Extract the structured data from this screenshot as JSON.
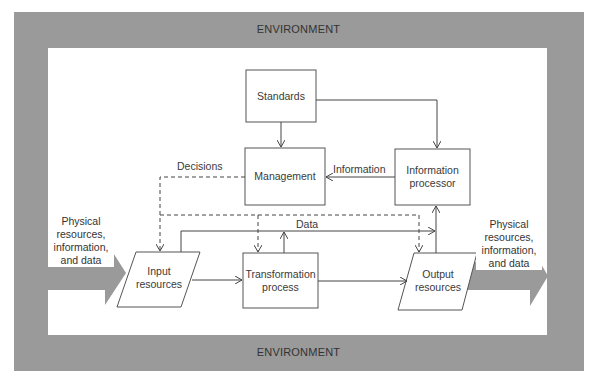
{
  "environment": {
    "top_label": "ENVIRONMENT",
    "bottom_label": "ENVIRONMENT",
    "frame_color": "#9a9a9a"
  },
  "nodes": {
    "standards": {
      "label": "Standards",
      "shape": "rectangle"
    },
    "management": {
      "label": "Management",
      "shape": "rectangle"
    },
    "information_processor": {
      "label_line1": "Information",
      "label_line2": "processor",
      "shape": "rectangle"
    },
    "input_resources": {
      "label_line1": "Input",
      "label_line2": "resources",
      "shape": "parallelogram"
    },
    "transformation_process": {
      "label_line1": "Transformation",
      "label_line2": "process",
      "shape": "rectangle"
    },
    "output_resources": {
      "label_line1": "Output",
      "label_line2": "resources",
      "shape": "parallelogram"
    }
  },
  "flows": {
    "decisions": "Decisions",
    "information": "Information",
    "data": "Data"
  },
  "external_flows": {
    "inbound": {
      "line1": "Physical",
      "line2": "resources,",
      "line3": "information,",
      "line4": "and data"
    },
    "outbound": {
      "line1": "Physical",
      "line2": "resources,",
      "line3": "information,",
      "line4": "and data"
    }
  },
  "edges": [
    {
      "from": "Standards",
      "to": "Management",
      "style": "solid"
    },
    {
      "from": "Standards",
      "to": "Information processor",
      "style": "solid"
    },
    {
      "from": "Information processor",
      "to": "Management",
      "style": "solid",
      "label": "Information"
    },
    {
      "from": "Management",
      "to": "Input resources",
      "style": "dashed",
      "label": "Decisions"
    },
    {
      "from": "Management",
      "to": "Transformation process",
      "style": "dashed"
    },
    {
      "from": "Management",
      "to": "Output resources",
      "style": "dashed"
    },
    {
      "from": "Input resources",
      "to": "Transformation process",
      "style": "solid"
    },
    {
      "from": "Transformation process",
      "to": "Output resources",
      "style": "solid"
    },
    {
      "from": "Input resources",
      "to": "Information processor",
      "style": "solid",
      "label": "Data"
    },
    {
      "from": "Transformation process",
      "to": "Data line",
      "style": "solid"
    },
    {
      "from": "Output resources",
      "to": "Information processor",
      "style": "solid"
    },
    {
      "from": "Environment",
      "to": "Input resources",
      "style": "thick-arrow"
    },
    {
      "from": "Output resources",
      "to": "Environment",
      "style": "thick-arrow"
    }
  ]
}
